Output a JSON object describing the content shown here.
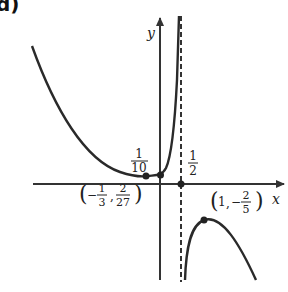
{
  "panel_label": "d)",
  "axes": {
    "x_label": "x",
    "y_label": "y"
  },
  "asymptote": {
    "x_value": "1/2",
    "style": "dashed"
  },
  "labels": {
    "y_intercept": {
      "num": "1",
      "den": "10"
    },
    "asymptote_x": {
      "num": "1",
      "den": "2"
    },
    "local_min": {
      "x_sign": "−",
      "x_num": "1",
      "x_den": "3",
      "y_num": "2",
      "y_den": "27"
    },
    "local_max": {
      "x": "1",
      "y_sign": "−",
      "y_num": "2",
      "y_den": "5"
    }
  },
  "points": [
    {
      "name": "local-min",
      "coords": "(-1/3, 2/27)"
    },
    {
      "name": "y-intercept",
      "coords": "(0, 1/10)"
    },
    {
      "name": "asymptote-x-intercept",
      "coords": "(1/2, 0)"
    },
    {
      "name": "local-max",
      "coords": "(1, -2/5)"
    }
  ],
  "colors": {
    "curve": "#2a2a2a",
    "axis": "#333333"
  }
}
